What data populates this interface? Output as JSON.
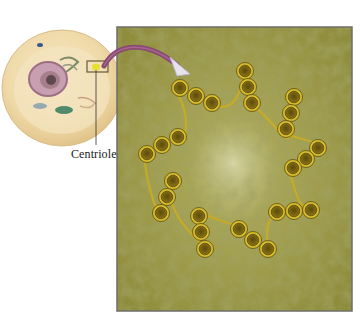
{
  "figure": {
    "callout_label": "Centriole",
    "magnified_panel": {
      "description": "Cross-section of a centriole showing nine triplets of microtubules arranged in a pinwheel",
      "triplet_count": 9,
      "microtubules_per_triplet": 3
    },
    "colors": {
      "cell_cytoplasm": "#f0dfb0",
      "nucleus": "#b58aa0",
      "panel_background": "#9c9a48",
      "microtubule_ring": "#d9bf2c",
      "microtubule_core": "#6e5a10",
      "arrow": "#8a4a72",
      "panel_border": "#6d6f67"
    }
  }
}
